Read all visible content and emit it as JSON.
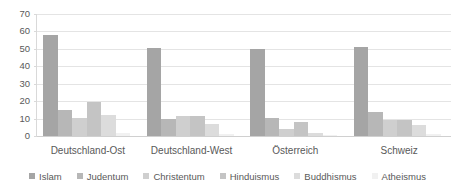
{
  "chart_data": {
    "type": "bar",
    "title": "",
    "subtitle": "",
    "xlabel": "",
    "ylabel": "",
    "ylim": [
      0,
      70
    ],
    "ytick_step": 10,
    "yticks": [
      "70",
      "60",
      "50",
      "40",
      "30",
      "20",
      "10",
      "0"
    ],
    "grid": true,
    "legend_position": "bottom",
    "categories": [
      "Deutschland-Ost",
      "Deutschland-West",
      "Österreich",
      "Schweiz"
    ],
    "series": [
      {
        "name": "Islam",
        "color": "#a5a5a5",
        "values": [
          58,
          50.5,
          50,
          51
        ]
      },
      {
        "name": "Judentum",
        "color": "#b7b7b7",
        "values": [
          15,
          9.8,
          10.5,
          14
        ]
      },
      {
        "name": "Christentum",
        "color": "#cfcfcf",
        "values": [
          10.5,
          11.5,
          4,
          9
        ]
      },
      {
        "name": "Hinduismus",
        "color": "#c4c4c4",
        "values": [
          19.5,
          11.5,
          8,
          9
        ]
      },
      {
        "name": "Buddhismus",
        "color": "#dcdcdc",
        "values": [
          12.3,
          7,
          2,
          6.5
        ]
      },
      {
        "name": "Atheismus",
        "color": "#f1f1f1",
        "values": [
          2,
          1,
          0.6,
          1.2
        ]
      }
    ]
  },
  "colors": {
    "gridline": "#e4e4e4",
    "axis": "#d9d9d9",
    "text": "#595959",
    "background": "#ffffff"
  }
}
